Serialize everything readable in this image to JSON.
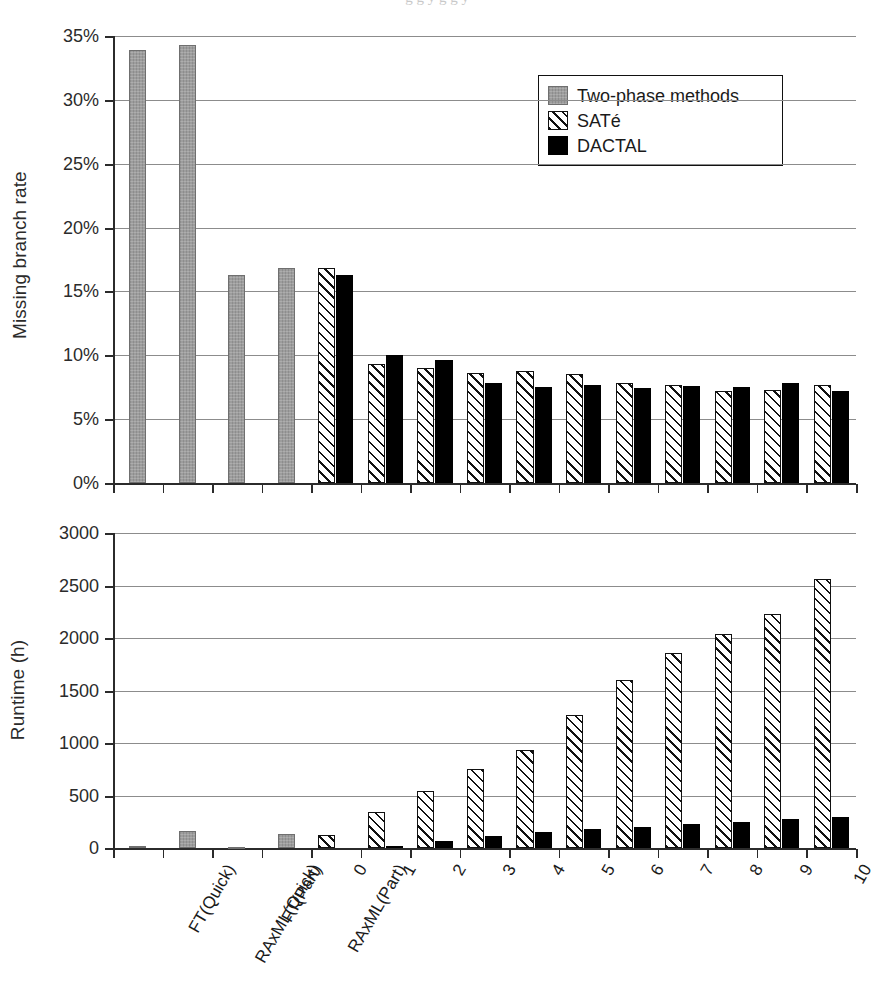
{
  "figure": {
    "background": "#ffffff",
    "clipped_caption_fragment": "g g y g g y"
  },
  "legend": {
    "position": "top-right of upper panel",
    "entries": [
      {
        "label": "Two-phase methods",
        "key": "twophase",
        "color": "#9d9d9d",
        "pattern": "solid-gray"
      },
      {
        "label": "SATé",
        "key": "sate",
        "color": "#ffffff",
        "pattern": "diagonal-hatch"
      },
      {
        "label": "DACTAL",
        "key": "dactal",
        "color": "#000000",
        "pattern": "solid-black"
      }
    ]
  },
  "categories": [
    "FT(Quick)",
    "RAxML(Quick)",
    "FT(Part)",
    "RAxML(Part)",
    "0",
    "1",
    "2",
    "3",
    "4",
    "5",
    "6",
    "7",
    "8",
    "9",
    "10"
  ],
  "chart_data": [
    {
      "type": "bar",
      "title": "",
      "panel": "upper",
      "xlabel": "",
      "ylabel": "Missing branch rate",
      "ylim": [
        0,
        35
      ],
      "yticks": [
        0,
        5,
        10,
        15,
        20,
        25,
        30,
        35
      ],
      "ytick_labels": [
        "0%",
        "5%",
        "10%",
        "15%",
        "20%",
        "25%",
        "30%",
        "35%"
      ],
      "yunit": "%",
      "grid": true,
      "legend_position": "upper right",
      "categories": [
        "FT(Quick)",
        "RAxML(Quick)",
        "FT(Part)",
        "RAxML(Part)",
        "0",
        "1",
        "2",
        "3",
        "4",
        "5",
        "6",
        "7",
        "8",
        "9",
        "10"
      ],
      "series": [
        {
          "name": "Two-phase methods",
          "key": "twophase",
          "values": [
            33.9,
            34.3,
            16.3,
            16.8,
            null,
            null,
            null,
            null,
            null,
            null,
            null,
            null,
            null,
            null,
            null
          ]
        },
        {
          "name": "SATé",
          "key": "sate",
          "values": [
            null,
            null,
            null,
            null,
            16.8,
            9.3,
            9.0,
            8.6,
            8.8,
            8.5,
            7.8,
            7.7,
            7.2,
            7.3,
            7.7
          ]
        },
        {
          "name": "DACTAL",
          "key": "dactal",
          "values": [
            null,
            null,
            null,
            null,
            16.3,
            10.0,
            9.65,
            7.8,
            7.5,
            7.7,
            7.45,
            7.6,
            7.55,
            7.85,
            7.2
          ]
        }
      ]
    },
    {
      "type": "bar",
      "title": "",
      "panel": "lower",
      "xlabel": "",
      "ylabel": "Runtime (h)",
      "ylim": [
        0,
        3000
      ],
      "yticks": [
        0,
        500,
        1000,
        1500,
        2000,
        2500,
        3000
      ],
      "ytick_labels": [
        "0",
        "500",
        "1000",
        "1500",
        "2000",
        "2500",
        "3000"
      ],
      "yunit": "h",
      "grid": true,
      "legend_position": "none",
      "categories": [
        "FT(Quick)",
        "RAxML(Quick)",
        "FT(Part)",
        "RAxML(Part)",
        "0",
        "1",
        "2",
        "3",
        "4",
        "5",
        "6",
        "7",
        "8",
        "9",
        "10"
      ],
      "series": [
        {
          "name": "Two-phase methods",
          "key": "twophase",
          "values": [
            18,
            165,
            4,
            130,
            null,
            null,
            null,
            null,
            null,
            null,
            null,
            null,
            null,
            null,
            null
          ]
        },
        {
          "name": "SATé",
          "key": "sate",
          "values": [
            null,
            null,
            null,
            null,
            120,
            340,
            545,
            755,
            930,
            1270,
            1600,
            1855,
            2040,
            2230,
            2560
          ]
        },
        {
          "name": "DACTAL",
          "key": "dactal",
          "values": [
            null,
            null,
            null,
            null,
            0,
            20,
            65,
            110,
            155,
            180,
            200,
            230,
            250,
            275,
            300
          ]
        }
      ]
    }
  ]
}
